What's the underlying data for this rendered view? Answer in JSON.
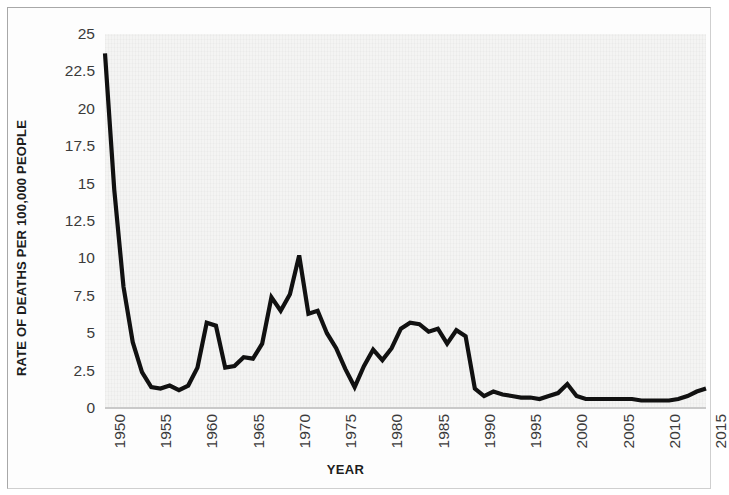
{
  "chart_data": {
    "type": "line",
    "title": "",
    "xlabel": "YEAR",
    "ylabel": "RATE OF DEATHS PER 100,000 PEOPLE",
    "xlim": [
      1950,
      2015
    ],
    "ylim": [
      0,
      25
    ],
    "grid": false,
    "legend": null,
    "y_ticks": [
      0,
      2.5,
      5,
      7.5,
      10,
      12.5,
      15,
      17.5,
      20,
      22.5,
      25
    ],
    "y_tick_labels": [
      "0",
      "2.5",
      "5",
      "7.5",
      "10",
      "12.5",
      "15",
      "17.5",
      "20",
      "22.5",
      "25"
    ],
    "x_ticks": [
      1950,
      1955,
      1960,
      1965,
      1970,
      1975,
      1980,
      1985,
      1990,
      1995,
      2000,
      2005,
      2010,
      2015
    ],
    "x_tick_labels": [
      "1950",
      "1955",
      "1960",
      "1965",
      "1970",
      "1975",
      "1980",
      "1985",
      "1990",
      "1995",
      "2000",
      "2005",
      "2010",
      "2015"
    ],
    "x_tick_rotation": 90,
    "series": [
      {
        "name": "Rate of deaths per 100,000 people",
        "color": "#111111",
        "x": [
          1950,
          1951,
          1952,
          1953,
          1954,
          1955,
          1956,
          1957,
          1958,
          1959,
          1960,
          1961,
          1962,
          1963,
          1964,
          1965,
          1966,
          1967,
          1968,
          1969,
          1970,
          1971,
          1972,
          1973,
          1974,
          1975,
          1976,
          1977,
          1978,
          1979,
          1980,
          1981,
          1982,
          1983,
          1984,
          1985,
          1986,
          1987,
          1988,
          1989,
          1990,
          1991,
          1992,
          1993,
          1994,
          1995,
          1996,
          1997,
          1998,
          1999,
          2000,
          2001,
          2002,
          2003,
          2004,
          2005,
          2006,
          2007,
          2008,
          2009,
          2010,
          2011,
          2012,
          2013,
          2014,
          2015
        ],
        "values": [
          23.7,
          14.6,
          8.1,
          4.4,
          2.4,
          1.4,
          1.3,
          1.5,
          1.2,
          1.5,
          2.7,
          5.7,
          5.5,
          2.7,
          2.8,
          3.4,
          3.3,
          4.3,
          7.4,
          6.5,
          7.6,
          10.2,
          6.3,
          6.5,
          5.0,
          4.0,
          2.6,
          1.4,
          2.8,
          3.9,
          3.2,
          4.0,
          5.3,
          5.7,
          5.6,
          5.1,
          5.3,
          4.3,
          5.2,
          4.8,
          1.3,
          0.8,
          1.1,
          0.9,
          0.8,
          0.7,
          0.7,
          0.6,
          0.8,
          1.0,
          1.6,
          0.8,
          0.6,
          0.6,
          0.6,
          0.6,
          0.6,
          0.6,
          0.5,
          0.5,
          0.5,
          0.5,
          0.6,
          0.8,
          1.1,
          1.3
        ]
      }
    ],
    "notes": {
      "line_style": "solid",
      "line_width_px": 4,
      "markers": "none",
      "plot_background": "#f4f4f3",
      "figure_background": "#ffffff",
      "border_color": "#a8a8a8"
    }
  }
}
